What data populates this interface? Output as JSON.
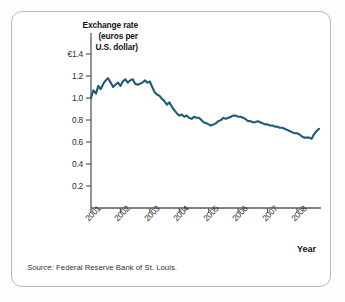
{
  "figure": {
    "title_lines": [
      "Exchange rate",
      "(euros per",
      "U.S. dollar)"
    ],
    "x_axis_name": "Year",
    "source_prefix": "Source:",
    "source_text": "Federal Reserve Bank of St. Louis.",
    "line_color": "#1d5c78",
    "axis_color": "#58585a",
    "border_color": "#b9b9b9"
  },
  "chart_data": {
    "type": "line",
    "title": "Exchange rate (euros per U.S. dollar)",
    "xlabel": "Year",
    "ylabel": "Exchange rate (euros per U.S. dollar)",
    "grid": false,
    "legend": "none",
    "ylim": [
      0,
      1.4
    ],
    "yticks": [
      0.2,
      0.4,
      0.6,
      0.8,
      1.0,
      1.2,
      1.4
    ],
    "ytick_labels": [
      "0.2",
      "0.4",
      "0.6",
      "0.8",
      "1.0",
      "1.2",
      "€1.4"
    ],
    "xlim": [
      2001.0,
      2008.75
    ],
    "xticks": [
      2001,
      2002,
      2003,
      2004,
      2005,
      2006,
      2007,
      2008
    ],
    "xtick_labels": [
      "2001",
      "2002",
      "2003",
      "2004",
      "2005",
      "2006",
      "2007",
      "2008"
    ],
    "series": [
      {
        "name": "Euros per U.S. dollar",
        "x": [
          2001.0,
          2001.08,
          2001.17,
          2001.25,
          2001.33,
          2001.42,
          2001.5,
          2001.58,
          2001.67,
          2001.75,
          2001.83,
          2001.92,
          2002.0,
          2002.08,
          2002.17,
          2002.25,
          2002.33,
          2002.42,
          2002.5,
          2002.58,
          2002.67,
          2002.75,
          2002.83,
          2002.92,
          2003.0,
          2003.08,
          2003.17,
          2003.25,
          2003.33,
          2003.42,
          2003.5,
          2003.58,
          2003.67,
          2003.75,
          2003.83,
          2003.92,
          2004.0,
          2004.08,
          2004.17,
          2004.25,
          2004.33,
          2004.42,
          2004.5,
          2004.58,
          2004.67,
          2004.75,
          2004.83,
          2004.92,
          2005.0,
          2005.08,
          2005.17,
          2005.25,
          2005.33,
          2005.42,
          2005.5,
          2005.58,
          2005.67,
          2005.75,
          2005.83,
          2005.92,
          2006.0,
          2006.08,
          2006.17,
          2006.25,
          2006.33,
          2006.42,
          2006.5,
          2006.58,
          2006.67,
          2006.75,
          2006.83,
          2006.92,
          2007.0,
          2007.08,
          2007.17,
          2007.25,
          2007.33,
          2007.42,
          2007.5,
          2007.58,
          2007.67,
          2007.75,
          2007.83,
          2007.92,
          2008.0,
          2008.08,
          2008.17,
          2008.25,
          2008.33,
          2008.42,
          2008.5,
          2008.58,
          2008.67,
          2008.75
        ],
        "values": [
          1.0,
          1.07,
          1.04,
          1.11,
          1.08,
          1.13,
          1.16,
          1.18,
          1.14,
          1.1,
          1.12,
          1.14,
          1.11,
          1.15,
          1.17,
          1.14,
          1.16,
          1.17,
          1.13,
          1.12,
          1.13,
          1.14,
          1.16,
          1.14,
          1.15,
          1.1,
          1.05,
          1.03,
          1.02,
          0.99,
          0.97,
          0.94,
          0.96,
          0.92,
          0.89,
          0.86,
          0.84,
          0.85,
          0.83,
          0.84,
          0.82,
          0.81,
          0.83,
          0.82,
          0.82,
          0.8,
          0.78,
          0.77,
          0.76,
          0.75,
          0.76,
          0.77,
          0.79,
          0.8,
          0.82,
          0.81,
          0.82,
          0.83,
          0.84,
          0.84,
          0.83,
          0.83,
          0.82,
          0.81,
          0.79,
          0.79,
          0.78,
          0.78,
          0.79,
          0.78,
          0.77,
          0.76,
          0.76,
          0.75,
          0.75,
          0.74,
          0.74,
          0.73,
          0.73,
          0.72,
          0.71,
          0.7,
          0.69,
          0.68,
          0.68,
          0.67,
          0.65,
          0.64,
          0.64,
          0.64,
          0.63,
          0.67,
          0.7,
          0.72
        ]
      }
    ]
  }
}
